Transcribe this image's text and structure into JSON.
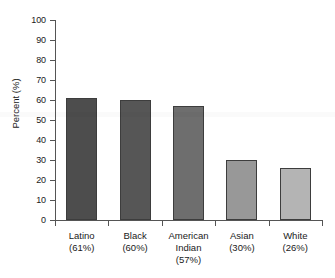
{
  "chart_data": {
    "type": "bar",
    "title": "",
    "subtitle": "",
    "xlabel": "",
    "ylabel": "Percent (%)",
    "ylim": [
      0,
      100
    ],
    "ytick_values": [
      0,
      10,
      20,
      30,
      40,
      50,
      60,
      70,
      80,
      90,
      100
    ],
    "ytick_labels": [
      "0",
      "10",
      "20",
      "30",
      "40",
      "50",
      "60",
      "70",
      "80",
      "90",
      "100"
    ],
    "grid": false,
    "legend": false,
    "legend_position": "none",
    "categories": [
      "Latino",
      "Black",
      "American Indian",
      "Asian",
      "White"
    ],
    "category_lines": [
      [
        "Latino",
        "(61%)"
      ],
      [
        "Black",
        "(60%)"
      ],
      [
        "American",
        "Indian",
        "(57%)"
      ],
      [
        "Asian",
        "(30%)"
      ],
      [
        "White",
        "(26%)"
      ]
    ],
    "values": [
      61,
      60,
      57,
      30,
      26
    ],
    "value_labels": [
      "(61%)",
      "(60%)",
      "(57%)",
      "(30%)",
      "(26%)"
    ],
    "bar_colors": [
      "#4d4d4d",
      "#565656",
      "#6e6e6e",
      "#989898",
      "#b4b4b4"
    ],
    "bar_edge_color": "#3d3d3d",
    "axis_color": "#555555",
    "background_color": "#ffffff",
    "text_color": "#1a1a1a"
  }
}
